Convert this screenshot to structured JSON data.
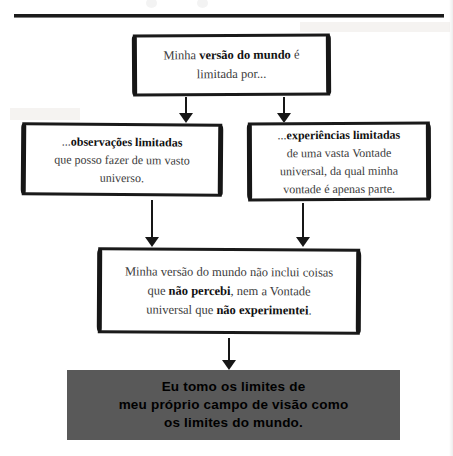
{
  "page": {
    "background_color": "#ffffff",
    "ink_color": "#1a1a1a",
    "text_color": "#3b3b3b",
    "conclusion_fill": "#595959"
  },
  "divider": {
    "label": "top-horizontal-rule"
  },
  "flow": {
    "top_box": {
      "name": "premise-box",
      "line1_pre": "Minha ",
      "line1_strong": "versão do mundo",
      "line1_post": " é",
      "line2": "limitada por..."
    },
    "left_box": {
      "name": "limited-observations-box",
      "lead_ellipsis": "...",
      "strong": "observações limitadas",
      "line2": "que posso fazer de um vasto",
      "line3": "universo."
    },
    "right_box": {
      "name": "limited-experiences-box",
      "lead_ellipsis": "...",
      "strong": "experiências limitadas",
      "line2": "de uma vasta Vontade",
      "line3": "universal, da qual minha",
      "line4": "vontade é apenas parte."
    },
    "middle_box": {
      "name": "synthesis-box",
      "line1": "Minha versão do mundo não inclui coisas",
      "line2_pre": "que ",
      "line2_strong": "não percebi",
      "line2_post": ", nem a Vontade",
      "line3_pre": "universal que ",
      "line3_strong": "não experimentei",
      "line3_post": "."
    },
    "conclusion_box": {
      "name": "conclusion-box",
      "line1": "Eu tomo os limites de",
      "line2": "meu próprio campo de visão como",
      "line3": "os limites do mundo."
    }
  },
  "connectors": [
    {
      "name": "arrow-premise-to-observations",
      "direction": "down"
    },
    {
      "name": "arrow-premise-to-experiences",
      "direction": "down"
    },
    {
      "name": "arrow-observations-to-synthesis",
      "direction": "down"
    },
    {
      "name": "arrow-experiences-to-synthesis",
      "direction": "down"
    },
    {
      "name": "arrow-synthesis-to-conclusion",
      "direction": "down"
    }
  ]
}
